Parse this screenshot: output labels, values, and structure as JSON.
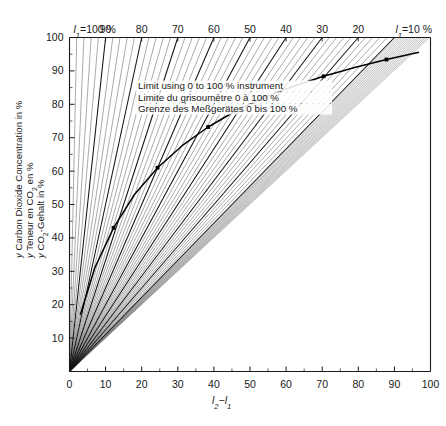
{
  "chart_data": {
    "type": "line",
    "title": "",
    "subtitle": "",
    "xlabel": "l₂−l₁",
    "ylabel_lines": [
      "y  Carbon Dioxide Concentration in %",
      "y  Teneur en CO₂ en %",
      "y  CO₂-Gehalt in %"
    ],
    "xlim": [
      0,
      100
    ],
    "ylim": [
      0,
      100
    ],
    "xticks": [
      0,
      10,
      20,
      30,
      40,
      50,
      60,
      70,
      80,
      90,
      100
    ],
    "xticklabels": [
      "0",
      "10",
      "20",
      "30",
      "40",
      "50",
      "60",
      "70",
      "80",
      "90",
      "100"
    ],
    "yticks": [
      10,
      20,
      30,
      40,
      50,
      60,
      70,
      80,
      90,
      100
    ],
    "yticklabels": [
      "10",
      "20",
      "30",
      "40",
      "50",
      "60",
      "70",
      "80",
      "90",
      "100"
    ],
    "grid": false,
    "legend_position": "none",
    "family_parameter_symbol": "l₁",
    "top_axis_label_left": "l₁=100 %",
    "top_axis_label_right": "l₁=10 %",
    "top_axis_ticklabels": [
      "90",
      "80",
      "70",
      "60",
      "50",
      "40",
      "30",
      "20"
    ],
    "top_axis_tickvalues": [
      90,
      80,
      70,
      60,
      50,
      40,
      30,
      20
    ],
    "bold_lines_l1": [
      100,
      90,
      80,
      70,
      60,
      50,
      40,
      30,
      20,
      10
    ],
    "thin_lines_l1": [
      98,
      96,
      94,
      92,
      88,
      86,
      84,
      82,
      78,
      76,
      74,
      72,
      68,
      66,
      64,
      62,
      58,
      56,
      54,
      52,
      48,
      46,
      44,
      42,
      38,
      36,
      34,
      32,
      28,
      26,
      24,
      22,
      18,
      16,
      14,
      12
    ],
    "ray_description": "Each line runs from the origin (0,0) to the point (100−l₁, 100) on the upper edge.",
    "limit_curve": {
      "name": "Limit using 0 to 100 % instrument",
      "x": [
        3.0,
        7.0,
        12.2,
        18.0,
        24.4,
        31.2,
        38.4,
        46.0,
        53.8,
        62.0,
        70.4,
        79.0,
        87.8,
        96.8
      ],
      "y": [
        17.0,
        31.0,
        43.0,
        53.0,
        61.0,
        67.6,
        73.2,
        78.0,
        82.0,
        85.4,
        88.4,
        91.0,
        93.4,
        95.6
      ],
      "markers_x": [
        12.2,
        24.4,
        38.4,
        53.8,
        70.4,
        87.8
      ],
      "markers_y": [
        43.0,
        61.0,
        73.2,
        82.0,
        88.4,
        93.4
      ]
    },
    "annotation": {
      "line1": "Limit using 0 to 100 % instrument",
      "line2": "Limite du grisoumètre 0 à 100 %",
      "line3": "Grenze des Meßgerätes 0 bis 100 %"
    },
    "colors": {
      "axis": "#1a1a1a",
      "thin_line": "#555555",
      "bold_line": "#111111",
      "curve": "#000000",
      "background": "#ffffff",
      "hatch": "#777777"
    }
  }
}
